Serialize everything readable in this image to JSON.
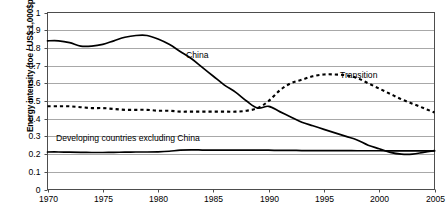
{
  "chart_data": {
    "type": "line",
    "title": "",
    "xlabel": "",
    "ylabel": "Energy intensity (toe / US$ 1,000$ppp)",
    "xlim": [
      1970,
      2005
    ],
    "ylim": [
      0,
      1
    ],
    "grid": true,
    "legend": "inline-annotations",
    "xticks": [
      "1970",
      "1975",
      "1980",
      "1985",
      "1990",
      "1995",
      "2000",
      "2005"
    ],
    "yticks": [
      "0",
      "0.1",
      "0.2",
      "0.3",
      "0.4",
      "0.5",
      "0.6",
      "0.7",
      "0.8",
      "0.9",
      "1"
    ],
    "series": [
      {
        "name": "China",
        "style": "solid",
        "label_text": "China",
        "x": [
          1970,
          1971,
          1972,
          1973,
          1974,
          1975,
          1976,
          1977,
          1978,
          1979,
          1980,
          1981,
          1982,
          1983,
          1984,
          1985,
          1986,
          1987,
          1988,
          1989,
          1990,
          1991,
          1992,
          1993,
          1994,
          1995,
          1996,
          1997,
          1998,
          1999,
          2000,
          2001,
          2002,
          2003,
          2004,
          2005
        ],
        "values": [
          0.84,
          0.84,
          0.83,
          0.81,
          0.81,
          0.82,
          0.84,
          0.86,
          0.87,
          0.87,
          0.85,
          0.82,
          0.78,
          0.74,
          0.69,
          0.64,
          0.59,
          0.55,
          0.5,
          0.46,
          0.47,
          0.44,
          0.41,
          0.38,
          0.36,
          0.34,
          0.32,
          0.3,
          0.28,
          0.25,
          0.23,
          0.21,
          0.2,
          0.2,
          0.21,
          0.22
        ]
      },
      {
        "name": "Transition",
        "style": "dotted",
        "label_text": "Transition",
        "x": [
          1970,
          1971,
          1972,
          1973,
          1974,
          1975,
          1976,
          1977,
          1978,
          1979,
          1980,
          1981,
          1982,
          1983,
          1984,
          1985,
          1986,
          1987,
          1988,
          1989,
          1990,
          1991,
          1992,
          1993,
          1994,
          1995,
          1996,
          1997,
          1998,
          1999,
          2000,
          2001,
          2002,
          2003,
          2004,
          2005
        ],
        "values": [
          0.47,
          0.47,
          0.47,
          0.465,
          0.46,
          0.46,
          0.455,
          0.45,
          0.45,
          0.45,
          0.445,
          0.445,
          0.44,
          0.44,
          0.44,
          0.44,
          0.44,
          0.44,
          0.445,
          0.46,
          0.5,
          0.56,
          0.6,
          0.62,
          0.64,
          0.65,
          0.65,
          0.645,
          0.63,
          0.6,
          0.57,
          0.54,
          0.51,
          0.485,
          0.46,
          0.435
        ]
      },
      {
        "name": "Developing countries excluding China",
        "style": "solid",
        "label_text": "Developing countries excluding China",
        "x": [
          1970,
          1971,
          1972,
          1973,
          1974,
          1975,
          1976,
          1977,
          1978,
          1979,
          1980,
          1981,
          1982,
          1983,
          1984,
          1985,
          1986,
          1987,
          1988,
          1989,
          1990,
          1991,
          1992,
          1993,
          1994,
          1995,
          1996,
          1997,
          1998,
          1999,
          2000,
          2001,
          2002,
          2003,
          2004,
          2005
        ],
        "values": [
          0.212,
          0.212,
          0.211,
          0.21,
          0.209,
          0.209,
          0.21,
          0.211,
          0.212,
          0.212,
          0.213,
          0.216,
          0.222,
          0.224,
          0.223,
          0.222,
          0.222,
          0.222,
          0.222,
          0.222,
          0.222,
          0.221,
          0.221,
          0.22,
          0.22,
          0.22,
          0.22,
          0.22,
          0.219,
          0.219,
          0.219,
          0.218,
          0.218,
          0.218,
          0.218,
          0.218
        ]
      }
    ]
  },
  "figure": {
    "caption": ""
  },
  "colors": {
    "line": "#000000",
    "grid": "#a8a8a8",
    "frame": "#4d4d4d",
    "background": "#ffffff"
  }
}
